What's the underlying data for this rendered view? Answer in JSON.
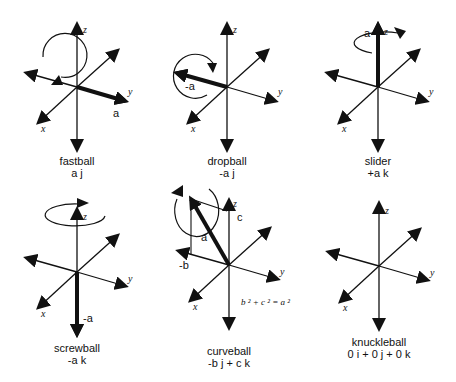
{
  "diagrams": [
    {
      "name": "fastball",
      "title": "fastball",
      "formula": "a j",
      "vector_label": "a"
    },
    {
      "name": "dropball",
      "title": "dropball",
      "formula": "-a j",
      "vector_label": "-a"
    },
    {
      "name": "slider",
      "title": "slider",
      "formula": "+a k",
      "vector_label": "a"
    },
    {
      "name": "screwball",
      "title": "screwball",
      "formula": "-a k",
      "vector_label": "-a"
    },
    {
      "name": "curveball",
      "title": "curveball",
      "formula": "-b j + c k",
      "vector_label": "a",
      "component_b": "-b",
      "component_c": "c",
      "equation": "b ² + c ² = a ²"
    },
    {
      "name": "knuckleball",
      "title": "knuckleball",
      "formula": "0 i + 0 j + 0 k"
    }
  ],
  "axes": {
    "x": "x",
    "y": "y",
    "z": "z"
  },
  "colors": {
    "ink": "#111111",
    "background": "#ffffff"
  }
}
